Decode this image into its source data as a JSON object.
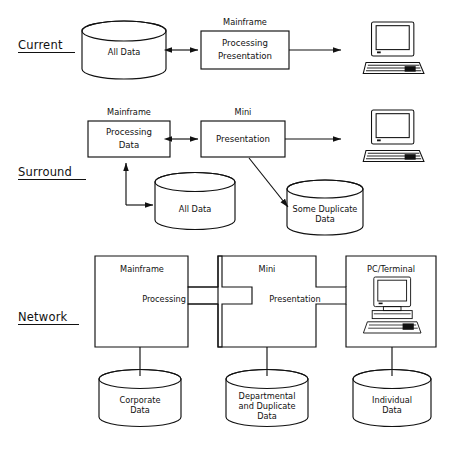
{
  "figure": {
    "caption": "",
    "ink_color": "#111111",
    "background_color": "#ffffff"
  },
  "rows": [
    {
      "id": "current",
      "label": "Current",
      "underlined": true,
      "elements": {
        "database": "All Data",
        "box_caption": "Mainframe",
        "box_line1": "Processing",
        "box_line2": "Presentation",
        "terminal": "computer-terminal"
      }
    },
    {
      "id": "surround",
      "label": "Surround",
      "underlined": true,
      "elements": {
        "box_left_caption": "Mainframe",
        "box_left_line1": "Processing",
        "box_left_line2": "Data",
        "box_right_caption": "Mini",
        "box_right_line1": "Presentation",
        "database_left": "All Data",
        "database_right_line1": "Some Duplicate",
        "database_right_line2": "Data",
        "terminal": "computer-terminal"
      }
    },
    {
      "id": "network",
      "label": "Network",
      "underlined": true,
      "elements": {
        "zone_left_caption": "Mainframe",
        "zone_mid_caption": "Mini",
        "zone_right_caption": "PC/Terminal",
        "joint_left_label": "Processing",
        "joint_right_label": "Presentation",
        "terminal": "computer-terminal",
        "database_left_line1": "Corporate",
        "database_left_line2": "Data",
        "database_mid_line1": "Departmental",
        "database_mid_line2": "and  Duplicate",
        "database_mid_line3": "Data",
        "database_right_line1": "Individual",
        "database_right_line2": "Data"
      }
    }
  ]
}
